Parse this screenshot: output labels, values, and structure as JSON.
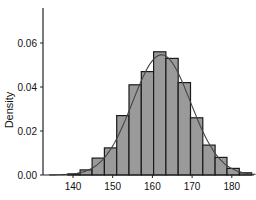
{
  "chart_data": {
    "type": "bar",
    "subtype": "histogram_with_density_curve",
    "title": "",
    "xlabel": "",
    "ylabel": "Density",
    "xlim": [
      134,
      185
    ],
    "ylim": [
      0,
      0.0755
    ],
    "xticks": [
      140,
      150,
      160,
      170,
      180
    ],
    "yticks": [
      0.0,
      0.02,
      0.04,
      0.06
    ],
    "ytick_labels": [
      "0.00",
      "0.02",
      "0.04",
      "0.06"
    ],
    "xtick_labels": [
      "140",
      "150",
      "160",
      "170",
      "180"
    ],
    "grid": false,
    "legend": null,
    "bin_edges": [
      138.7,
      141.8,
      144.8,
      147.9,
      151.0,
      154.1,
      157.2,
      160.3,
      163.4,
      166.5,
      169.6,
      172.7,
      175.8,
      178.8,
      181.9,
      185.0
    ],
    "values": [
      0.0005,
      0.0023,
      0.0077,
      0.0123,
      0.027,
      0.041,
      0.047,
      0.056,
      0.053,
      0.042,
      0.026,
      0.0136,
      0.008,
      0.003,
      0.001
    ],
    "density_curve": {
      "type": "normal",
      "mean": 162.3,
      "sd": 7.3
    },
    "colors": {
      "bar_fill": "#9a9a9a",
      "bar_edge": "#1a1a1a",
      "curve": "#444444",
      "axis": "#222222"
    }
  }
}
